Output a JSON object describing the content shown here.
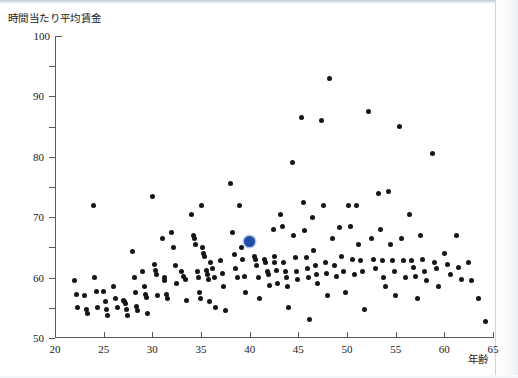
{
  "figure": {
    "y_axis_caption": "時間当たり平均賃金",
    "x_axis_caption": "年齢",
    "highlight_color": "#1f4fa8",
    "point_color": "#151515"
  },
  "chart_data": {
    "type": "scatter",
    "title": "",
    "subtitle": "",
    "xlabel": "年齢",
    "ylabel": "時間当たり平均賃金",
    "xlim": [
      20,
      65
    ],
    "ylim": [
      0,
      100
    ],
    "xticks": [
      20,
      25,
      30,
      35,
      40,
      45,
      50,
      55,
      60,
      65
    ],
    "yticks": [
      0,
      10,
      20,
      30,
      40,
      50,
      60,
      70,
      80,
      90,
      100
    ],
    "grid": false,
    "legend": "none",
    "series": [
      {
        "name": "労働者",
        "marker": "circle",
        "color": "#151515",
        "points": [
          [
            22.0,
            19.0
          ],
          [
            22.2,
            14.5
          ],
          [
            22.3,
            10.0
          ],
          [
            23.0,
            14.0
          ],
          [
            23.2,
            9.5
          ],
          [
            23.3,
            8.0
          ],
          [
            24.0,
            44.0
          ],
          [
            24.1,
            20.0
          ],
          [
            24.3,
            15.5
          ],
          [
            24.4,
            10.0
          ],
          [
            25.0,
            15.5
          ],
          [
            25.2,
            12.0
          ],
          [
            25.3,
            9.5
          ],
          [
            25.4,
            7.5
          ],
          [
            26.0,
            17.0
          ],
          [
            26.2,
            13.0
          ],
          [
            26.4,
            10.0
          ],
          [
            27.0,
            12.5
          ],
          [
            27.1,
            12.0
          ],
          [
            27.2,
            11.5
          ],
          [
            27.3,
            9.5
          ],
          [
            27.4,
            7.5
          ],
          [
            28.0,
            28.5
          ],
          [
            28.2,
            20.0
          ],
          [
            28.3,
            15.0
          ],
          [
            28.4,
            10.5
          ],
          [
            28.5,
            9.0
          ],
          [
            29.0,
            22.0
          ],
          [
            29.2,
            17.0
          ],
          [
            29.3,
            14.5
          ],
          [
            29.4,
            13.5
          ],
          [
            29.5,
            8.0
          ],
          [
            30.0,
            47.0
          ],
          [
            30.2,
            24.5
          ],
          [
            30.3,
            22.5
          ],
          [
            30.4,
            21.0
          ],
          [
            30.5,
            14.0
          ],
          [
            31.0,
            33.0
          ],
          [
            31.2,
            20.0
          ],
          [
            31.3,
            19.0
          ],
          [
            31.5,
            14.5
          ],
          [
            31.6,
            13.0
          ],
          [
            32.0,
            35.0
          ],
          [
            32.2,
            30.0
          ],
          [
            32.4,
            24.0
          ],
          [
            32.5,
            18.0
          ],
          [
            33.0,
            22.0
          ],
          [
            33.2,
            20.5
          ],
          [
            33.4,
            19.5
          ],
          [
            33.5,
            12.5
          ],
          [
            34.0,
            41.0
          ],
          [
            34.2,
            34.0
          ],
          [
            34.3,
            33.0
          ],
          [
            34.4,
            31.0
          ],
          [
            34.6,
            22.0
          ],
          [
            34.7,
            20.0
          ],
          [
            34.8,
            15.0
          ],
          [
            34.9,
            13.0
          ],
          [
            35.0,
            44.0
          ],
          [
            35.2,
            30.0
          ],
          [
            35.3,
            28.0
          ],
          [
            35.4,
            27.0
          ],
          [
            35.6,
            22.5
          ],
          [
            35.7,
            21.0
          ],
          [
            35.8,
            19.5
          ],
          [
            35.9,
            12.0
          ],
          [
            36.0,
            25.0
          ],
          [
            36.2,
            23.0
          ],
          [
            36.4,
            20.0
          ],
          [
            36.5,
            10.0
          ],
          [
            37.0,
            25.5
          ],
          [
            37.2,
            21.5
          ],
          [
            37.3,
            17.0
          ],
          [
            37.5,
            9.0
          ],
          [
            38.0,
            51.0
          ],
          [
            38.2,
            35.0
          ],
          [
            38.4,
            27.5
          ],
          [
            38.5,
            23.0
          ],
          [
            38.7,
            20.0
          ],
          [
            39.0,
            44.0
          ],
          [
            39.2,
            30.0
          ],
          [
            39.3,
            26.0
          ],
          [
            39.5,
            20.5
          ],
          [
            39.6,
            15.0
          ],
          [
            40.1,
            31.5
          ],
          [
            40.5,
            27.0
          ],
          [
            40.6,
            26.0
          ],
          [
            40.7,
            24.0
          ],
          [
            40.9,
            20.0
          ],
          [
            41.0,
            13.0
          ],
          [
            41.5,
            26.0
          ],
          [
            41.6,
            25.0
          ],
          [
            41.8,
            22.0
          ],
          [
            41.9,
            21.0
          ],
          [
            42.0,
            17.5
          ],
          [
            42.4,
            36.0
          ],
          [
            42.5,
            27.0
          ],
          [
            42.6,
            25.0
          ],
          [
            42.8,
            22.5
          ],
          [
            42.9,
            18.0
          ],
          [
            43.2,
            41.0
          ],
          [
            43.4,
            37.0
          ],
          [
            43.5,
            25.0
          ],
          [
            43.7,
            22.0
          ],
          [
            43.8,
            20.0
          ],
          [
            43.9,
            17.0
          ],
          [
            44.0,
            10.0
          ],
          [
            44.4,
            58.0
          ],
          [
            44.5,
            34.0
          ],
          [
            44.7,
            26.5
          ],
          [
            44.8,
            22.0
          ],
          [
            44.9,
            19.5
          ],
          [
            45.3,
            73.0
          ],
          [
            45.5,
            45.0
          ],
          [
            45.6,
            35.5
          ],
          [
            45.8,
            26.5
          ],
          [
            45.9,
            23.0
          ],
          [
            46.0,
            20.0
          ],
          [
            46.1,
            6.0
          ],
          [
            46.5,
            40.0
          ],
          [
            46.6,
            29.0
          ],
          [
            46.8,
            24.0
          ],
          [
            46.9,
            21.0
          ],
          [
            47.0,
            18.0
          ],
          [
            47.4,
            72.0
          ],
          [
            47.6,
            44.0
          ],
          [
            47.8,
            25.0
          ],
          [
            47.9,
            21.5
          ],
          [
            48.0,
            14.0
          ],
          [
            48.2,
            86.0
          ],
          [
            48.5,
            33.0
          ],
          [
            48.7,
            24.0
          ],
          [
            48.9,
            20.5
          ],
          [
            49.2,
            36.5
          ],
          [
            49.4,
            27.0
          ],
          [
            49.6,
            22.0
          ],
          [
            49.8,
            15.0
          ],
          [
            50.2,
            44.0
          ],
          [
            50.4,
            37.0
          ],
          [
            50.6,
            26.0
          ],
          [
            50.8,
            21.0
          ],
          [
            51.0,
            44.0
          ],
          [
            51.2,
            31.0
          ],
          [
            51.4,
            25.5
          ],
          [
            51.6,
            22.0
          ],
          [
            51.8,
            9.5
          ],
          [
            52.2,
            75.0
          ],
          [
            52.5,
            33.0
          ],
          [
            52.7,
            26.0
          ],
          [
            52.9,
            23.0
          ],
          [
            53.2,
            48.0
          ],
          [
            53.4,
            36.0
          ],
          [
            53.6,
            25.5
          ],
          [
            53.8,
            20.0
          ],
          [
            54.0,
            17.0
          ],
          [
            54.3,
            48.5
          ],
          [
            54.5,
            31.0
          ],
          [
            54.7,
            25.5
          ],
          [
            54.9,
            22.0
          ],
          [
            55.0,
            14.0
          ],
          [
            55.4,
            70.0
          ],
          [
            55.6,
            33.0
          ],
          [
            55.8,
            25.5
          ],
          [
            56.0,
            20.0
          ],
          [
            56.4,
            41.0
          ],
          [
            56.6,
            25.5
          ],
          [
            56.8,
            23.5
          ],
          [
            57.0,
            20.5
          ],
          [
            57.2,
            13.0
          ],
          [
            57.6,
            34.0
          ],
          [
            57.8,
            26.0
          ],
          [
            58.0,
            22.0
          ],
          [
            58.2,
            19.0
          ],
          [
            58.8,
            61.0
          ],
          [
            59.0,
            25.0
          ],
          [
            59.2,
            23.0
          ],
          [
            59.4,
            17.0
          ],
          [
            60.0,
            28.0
          ],
          [
            60.3,
            24.5
          ],
          [
            60.6,
            21.0
          ],
          [
            61.2,
            34.0
          ],
          [
            61.5,
            23.5
          ],
          [
            61.8,
            19.5
          ],
          [
            62.5,
            25.0
          ],
          [
            62.8,
            19.0
          ],
          [
            63.5,
            13.0
          ],
          [
            64.2,
            5.5
          ]
        ]
      },
      {
        "name": "注目の個人",
        "marker": "circle-large",
        "color": "#1f4fa8",
        "points": [
          [
            40.0,
            32.0
          ]
        ]
      }
    ]
  }
}
